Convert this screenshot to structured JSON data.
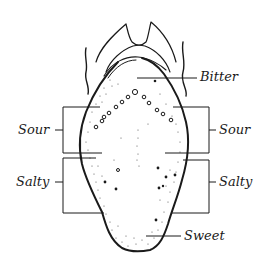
{
  "diagram": {
    "labels": {
      "bitter": "Bitter",
      "sour_left": "Sour",
      "sour_right": "Sour",
      "salty_left": "Salty",
      "salty_right": "Salty",
      "sweet": "Sweet"
    },
    "colors": {
      "stroke": "#1a1a1a",
      "background": "#ffffff",
      "stipple": "#555555"
    }
  }
}
